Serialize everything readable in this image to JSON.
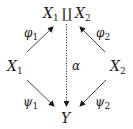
{
  "diagram": {
    "type": "commutative-diagram",
    "nodes": {
      "top": {
        "base1": "X",
        "sub1": "1",
        "op": "∐",
        "base2": "X",
        "sub2": "2"
      },
      "left": {
        "base": "X",
        "sub": "1"
      },
      "right": {
        "base": "X",
        "sub": "2"
      },
      "bottom": {
        "base": "Y"
      }
    },
    "arrows": {
      "phi1": {
        "from": "X1",
        "to": "X1 ∐ X2",
        "label_base": "φ",
        "label_sub": "1",
        "style": "solid"
      },
      "phi2": {
        "from": "X2",
        "to": "X1 ∐ X2",
        "label_base": "φ",
        "label_sub": "2",
        "style": "solid"
      },
      "alpha": {
        "from": "X1 ∐ X2",
        "to": "Y",
        "label": "α",
        "style": "dotted"
      },
      "psi1": {
        "from": "X1",
        "to": "Y",
        "label_base": "ψ",
        "label_sub": "1",
        "style": "solid"
      },
      "psi2": {
        "from": "X2",
        "to": "Y",
        "label_base": "ψ",
        "label_sub": "2",
        "style": "solid"
      }
    },
    "colors": {
      "ink": "#1a1a1a",
      "background": "#ffffff"
    }
  }
}
